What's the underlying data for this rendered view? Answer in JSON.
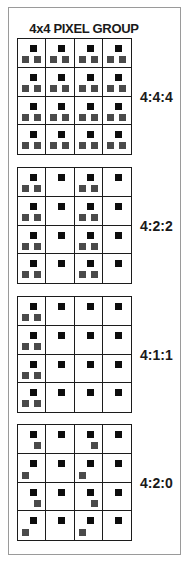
{
  "title": "4x4 PIXEL GROUP",
  "colors": {
    "luma": "#0d0d0d",
    "chroma": "#4a4a4a",
    "grid_line": "#1c1c1c",
    "frame": "#9a9a9a"
  },
  "schemes": [
    {
      "label": "4:4:4",
      "top": 38,
      "chroma_pattern": [
        [
          "both",
          "both",
          "both",
          "both"
        ],
        [
          "both",
          "both",
          "both",
          "both"
        ],
        [
          "both",
          "both",
          "both",
          "both"
        ],
        [
          "both",
          "both",
          "both",
          "both"
        ]
      ]
    },
    {
      "label": "4:2:2",
      "top": 167,
      "chroma_pattern": [
        [
          "both",
          "none",
          "both",
          "none"
        ],
        [
          "both",
          "none",
          "both",
          "none"
        ],
        [
          "both",
          "none",
          "both",
          "none"
        ],
        [
          "both",
          "none",
          "both",
          "none"
        ]
      ]
    },
    {
      "label": "4:1:1",
      "top": 296,
      "chroma_pattern": [
        [
          "both",
          "none",
          "none",
          "none"
        ],
        [
          "both",
          "none",
          "none",
          "none"
        ],
        [
          "both",
          "none",
          "none",
          "none"
        ],
        [
          "both",
          "none",
          "none",
          "none"
        ]
      ]
    },
    {
      "label": "4:2:0",
      "top": 424,
      "chroma_pattern": [
        [
          "right",
          "none",
          "right",
          "none"
        ],
        [
          "left",
          "none",
          "left",
          "none"
        ],
        [
          "right",
          "none",
          "right",
          "none"
        ],
        [
          "left",
          "none",
          "left",
          "none"
        ]
      ]
    }
  ],
  "legend_note": "Black square = luma sample per pixel; gray squares = chroma samples"
}
